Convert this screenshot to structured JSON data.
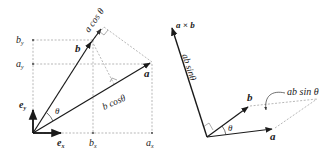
{
  "left_diagram": {
    "title": "dot product",
    "labels": {
      "b_y": "b",
      "b_y_sub": "y",
      "a_y": "a",
      "a_y_sub": "y",
      "e_y": "e",
      "e_y_sub": "y",
      "e_x": "e",
      "e_x_sub": "x",
      "b_x": "b",
      "b_x_sub": "x",
      "a_x": "a",
      "a_x_sub": "x",
      "vec_a": "a",
      "vec_b": "b",
      "theta": "θ",
      "a_cos_theta": "a cos θ",
      "b_cos_theta": "b cosθ"
    }
  },
  "right_diagram": {
    "title": "cross product",
    "labels": {
      "a_cross_b": "a × b",
      "ab_sin_theta_vertical": "ab sinθ",
      "vec_a": "a",
      "vec_b": "b",
      "theta": "θ",
      "ab_sin_theta_area": "ab sin θ"
    }
  },
  "colors": {
    "vector": "#1a1a1a",
    "dashed": "#9a9a9a",
    "text": "#222222"
  }
}
